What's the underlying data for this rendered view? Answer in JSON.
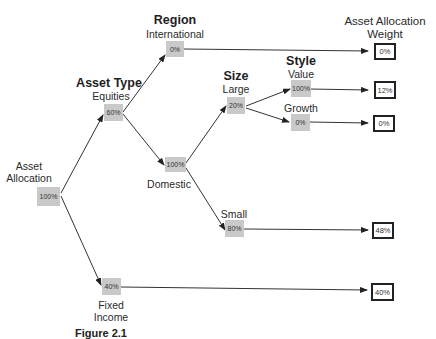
{
  "headers": {
    "asset_type": "Asset Type",
    "region": "Region",
    "size": "Size",
    "style": "Style",
    "weight_line1": "Asset Allocation",
    "weight_line2": "Weight"
  },
  "nodes": {
    "root": {
      "label_line1": "Asset",
      "label_line2": "Allocation",
      "value": "100%"
    },
    "equities": {
      "label": "Equities",
      "value": "60%"
    },
    "fixed_income": {
      "label_line1": "Fixed",
      "label_line2": "Income",
      "value": "40%"
    },
    "international": {
      "label": "International",
      "value": "0%"
    },
    "domestic": {
      "label": "Domestic",
      "value": "100%"
    },
    "large": {
      "label": "Large",
      "value": "20%"
    },
    "small": {
      "label": "Small",
      "value": "80%"
    },
    "value": {
      "label": "Value",
      "value": "100%"
    },
    "growth": {
      "label": "Growth",
      "value": "0%"
    }
  },
  "outputs": {
    "international": "0%",
    "large_value": "12%",
    "large_growth": "0%",
    "small": "48%",
    "fixed_income": "40%"
  },
  "caption": "Figure 2.1"
}
